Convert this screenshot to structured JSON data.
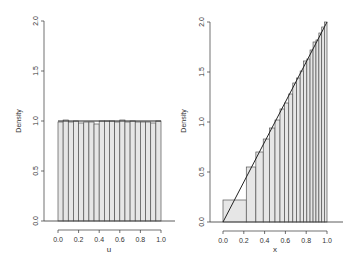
{
  "chart_data": [
    {
      "type": "bar",
      "subtype": "histogram",
      "title": "",
      "xlabel": "u",
      "ylabel": "Density",
      "xlim": [
        0,
        1
      ],
      "ylim": [
        0,
        2
      ],
      "xticks": [
        "0.0",
        "0.2",
        "0.4",
        "0.6",
        "0.8",
        "1.0"
      ],
      "yticks": [
        "0.0",
        "0.5",
        "1.0",
        "1.5",
        "2.0"
      ],
      "breaks": [
        0,
        0.05,
        0.1,
        0.15,
        0.2,
        0.25,
        0.3,
        0.35,
        0.4,
        0.45,
        0.5,
        0.55,
        0.6,
        0.65,
        0.7,
        0.75,
        0.8,
        0.85,
        0.9,
        0.95,
        1.0
      ],
      "values": [
        0.99,
        1.01,
        0.99,
        1.0,
        0.98,
        0.99,
        0.99,
        0.97,
        1.0,
        1.0,
        1.0,
        0.99,
        1.01,
        0.99,
        1.0,
        0.99,
        0.99,
        0.99,
        0.98,
        1.0
      ],
      "density_line": {
        "x": [
          0,
          1
        ],
        "y": [
          1,
          1
        ]
      }
    },
    {
      "type": "bar",
      "subtype": "histogram",
      "title": "",
      "xlabel": "x",
      "ylabel": "Density",
      "xlim": [
        0,
        1
      ],
      "ylim": [
        0,
        2
      ],
      "xticks": [
        "0.0",
        "0.2",
        "0.4",
        "0.6",
        "0.8",
        "1.0"
      ],
      "yticks": [
        "0.0",
        "0.5",
        "1.0",
        "1.5",
        "2.0"
      ],
      "breaks": [
        0,
        0.224,
        0.316,
        0.387,
        0.447,
        0.5,
        0.548,
        0.592,
        0.632,
        0.671,
        0.707,
        0.742,
        0.775,
        0.806,
        0.837,
        0.866,
        0.894,
        0.922,
        0.949,
        0.975,
        1.0
      ],
      "values": [
        0.22,
        0.55,
        0.7,
        0.83,
        0.94,
        1.02,
        1.13,
        1.19,
        1.28,
        1.39,
        1.44,
        1.51,
        1.61,
        1.63,
        1.72,
        1.8,
        1.82,
        1.89,
        1.95,
        2.0
      ],
      "density_line": {
        "x": [
          0,
          1
        ],
        "y": [
          0,
          2
        ]
      }
    }
  ],
  "panels": {
    "left": {
      "xlabel": "u",
      "ylabel": "Density"
    },
    "right": {
      "xlabel": "x",
      "ylabel": "Density"
    }
  },
  "colors": {
    "bar_fill": "#e6e6e6",
    "bar_stroke": "#555555",
    "axis": "#333333",
    "line": "#222222"
  }
}
